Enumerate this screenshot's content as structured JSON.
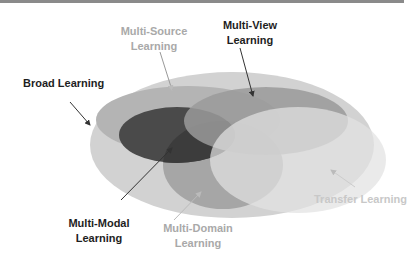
{
  "diagram": {
    "type": "nested-venn",
    "labels": {
      "broad": "Broad Learning",
      "multi_source_1": "Multi-Source",
      "multi_source_2": "Learning",
      "multi_view_1": "Multi-View",
      "multi_view_2": "Learning",
      "multi_modal_1": "Multi-Modal",
      "multi_modal_2": "Learning",
      "multi_domain_1": "Multi-Domain",
      "multi_domain_2": "Learning",
      "transfer": "Transfer Learning"
    },
    "colors": {
      "broad_fill": "#d2d2d2",
      "multi_source_fill": "#b4b4b4",
      "multi_view_fill": "#9a9a9a",
      "multi_modal_fill": "#4a4a4a",
      "multi_domain_fill": "#a8a8a8",
      "transfer_fill": "#dedede",
      "arrow_dark": "#333333",
      "arrow_light": "#bbbbbb"
    }
  }
}
